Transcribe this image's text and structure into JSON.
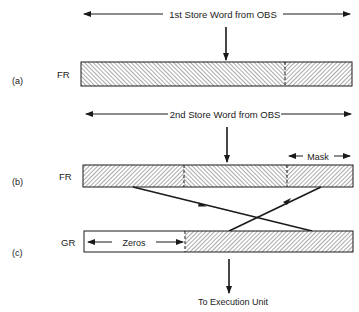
{
  "diagram": {
    "row_a": {
      "tag": "(a)",
      "register": "FR",
      "span_label": "1st Store Word from OBS"
    },
    "row_b": {
      "tag": "(b)",
      "register": "FR",
      "span_label": "2nd Store Word from OBS",
      "mask_label": "Mask"
    },
    "row_c": {
      "tag": "(c)",
      "register": "GR",
      "zeros_label": "Zeros"
    },
    "output_label": "To Execution Unit",
    "colors": {
      "ink": "#1a1a1a",
      "background": "#ffffff"
    }
  }
}
